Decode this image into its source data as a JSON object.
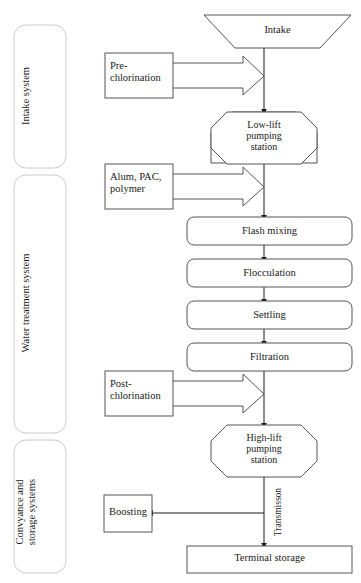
{
  "diagram": {
    "stroke_color": "#555555",
    "group_stroke_color": "#cccccc",
    "background": "#ffffff"
  },
  "groups": [
    {
      "id": "group-intake",
      "label": "Intake system"
    },
    {
      "id": "group-treatment",
      "label": "Water treatment system"
    },
    {
      "id": "group-conveyance",
      "label": "Convyance and\nstorage systems"
    }
  ],
  "nodes": {
    "intake": {
      "label": "Intake",
      "shape": "trapezoid"
    },
    "pre_chlorination": {
      "label": "Pre-\nchlorination",
      "shape": "rectangle"
    },
    "low_lift": {
      "label": "Low-lift\npumping\nstation",
      "shape": "octagon"
    },
    "coagulants": {
      "label": "Alum, PAC,\npolymer",
      "shape": "rectangle"
    },
    "flash_mixing": {
      "label": "Flash mixing",
      "shape": "rounded-rectangle"
    },
    "flocculation": {
      "label": "Flocculation",
      "shape": "rounded-rectangle"
    },
    "settling": {
      "label": "Settling",
      "shape": "rounded-rectangle"
    },
    "filtration": {
      "label": "Filtration",
      "shape": "rounded-rectangle"
    },
    "post_chlorination": {
      "label": "Post-\nchlorination",
      "shape": "rectangle"
    },
    "high_lift": {
      "label": "High-lift\npumping\nstation",
      "shape": "octagon"
    },
    "boosting": {
      "label": "Boosting",
      "shape": "rectangle"
    },
    "terminal_storage": {
      "label": "Terminal storage",
      "shape": "rectangle"
    }
  },
  "edges": {
    "transmission": {
      "label": "Transmisson"
    }
  }
}
